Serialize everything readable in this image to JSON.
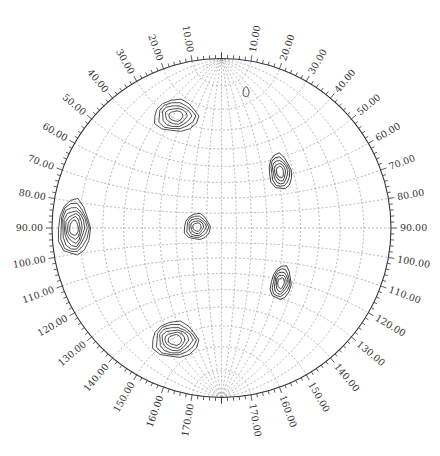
{
  "chart_data": {
    "type": "contour",
    "title": "",
    "projection": "stereographic (Wulff net) pole figure",
    "grid": {
      "meridian_step_deg": 10,
      "latitude_step_deg": 10,
      "style": "dotted gray"
    },
    "rim_labels_deg": [
      10,
      20,
      30,
      40,
      50,
      60,
      70,
      80,
      90,
      100,
      110,
      120,
      130,
      140,
      150,
      160,
      170
    ],
    "rim_label_format": "0.00",
    "rim_ticks_minor_step_deg": 2,
    "colors": {
      "contour": "#222222",
      "grid": "#9a9a9a",
      "rim": "#333333",
      "label": "#333333"
    },
    "peaks": [
      {
        "name": "upper-left",
        "cx": 176,
        "cy": 116,
        "rx": 22,
        "ry": 16,
        "levels": 5,
        "rot": 0
      },
      {
        "name": "center",
        "cx": 197,
        "cy": 227,
        "rx": 13,
        "ry": 13,
        "levels": 5,
        "rot": 0
      },
      {
        "name": "left-rim",
        "cx": 74,
        "cy": 228,
        "rx": 16,
        "ry": 28,
        "levels": 7,
        "rot": 0
      },
      {
        "name": "right-upper",
        "cx": 280,
        "cy": 172,
        "rx": 11,
        "ry": 18,
        "levels": 5,
        "rot": -10
      },
      {
        "name": "right-lower",
        "cx": 281,
        "cy": 283,
        "rx": 10,
        "ry": 17,
        "levels": 5,
        "rot": 10
      },
      {
        "name": "lower-left",
        "cx": 175,
        "cy": 340,
        "rx": 23,
        "ry": 18,
        "levels": 6,
        "rot": 0
      },
      {
        "name": "top-small",
        "cx": 246,
        "cy": 92,
        "rx": 3,
        "ry": 5,
        "levels": 1,
        "rot": 0
      }
    ]
  },
  "labels": {
    "l10": "10.00",
    "l20": "20.00",
    "l30": "30.00",
    "l40": "40.00",
    "l50": "50.00",
    "l60": "60.00",
    "l70": "70.00",
    "l80": "80.00",
    "l90": "90.00",
    "l100": "100.00",
    "l110": "110.00",
    "l120": "120.00",
    "l130": "130.00",
    "l140": "140.00",
    "l150": "150.00",
    "l160": "160.00",
    "l170": "170.00"
  }
}
